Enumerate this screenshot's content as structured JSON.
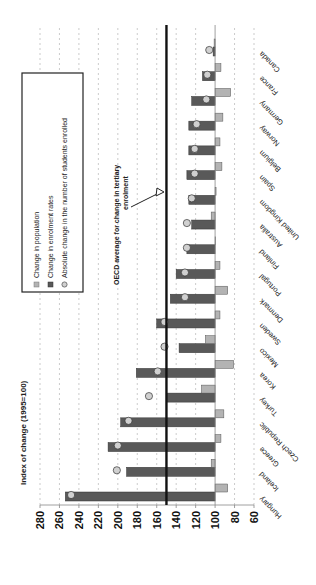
{
  "chart_data": {
    "type": "bar",
    "title": "",
    "ylabel": "Index of change (1995=100)",
    "xlabel": "",
    "ylim": [
      60,
      280
    ],
    "yticks": [
      280,
      260,
      240,
      220,
      200,
      180,
      160,
      140,
      120,
      100,
      80,
      60
    ],
    "baseline": 100,
    "grid": true,
    "orientation": "rotated-90",
    "categories": [
      "Hungary",
      "Iceland",
      "Greece",
      "Czech Republic",
      "Turkey",
      "Korea",
      "Mexico",
      "Sweden",
      "Denmark",
      "Portugal",
      "Finland",
      "Australia",
      "United Kingdom",
      "Spain",
      "Belgium",
      "Norway",
      "Germany",
      "France",
      "Canada"
    ],
    "series": [
      {
        "name": "Change in population",
        "kind": "bar",
        "color": "#b3b3b3",
        "values": [
          87,
          104,
          94,
          91,
          114,
          81,
          110,
          95,
          87,
          95,
          100,
          104,
          99,
          93,
          95,
          92,
          84,
          94,
          101
        ]
      },
      {
        "name": "Change in enrolment rates",
        "kind": "bar",
        "color": "#595959",
        "values": [
          254,
          191,
          210,
          197,
          150,
          181,
          137,
          160,
          146,
          140,
          129,
          124,
          127,
          129,
          127,
          127,
          124,
          113,
          102
        ]
      },
      {
        "name": "Absolute change in the number of students enrolled",
        "kind": "marker",
        "color": "#d0d0d0",
        "values": [
          248,
          201,
          200,
          189,
          168,
          159,
          152,
          152,
          131,
          131,
          129,
          129,
          124,
          121,
          121,
          119,
          109,
          108,
          106
        ]
      }
    ],
    "reference_line": {
      "value": 150,
      "label": "OECD average for change in tertiary enrolment"
    },
    "legend": {
      "position": "upper-left",
      "entries": [
        "Change in population",
        "Change in enrolment rates",
        "Absolute change in the number of students enrolled"
      ]
    }
  }
}
